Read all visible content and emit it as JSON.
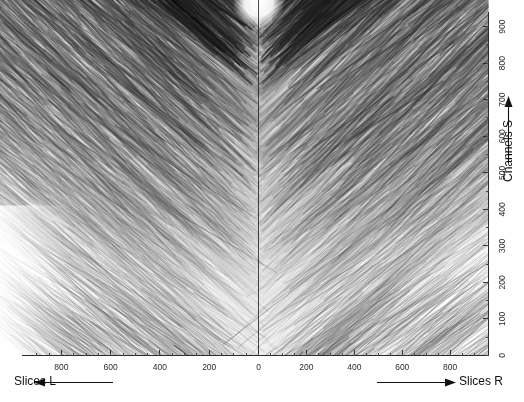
{
  "figure": {
    "width": 524,
    "height": 402,
    "background_color": "#ffffff",
    "ink_color": "#222222"
  },
  "chart_data": {
    "type": "heatmap",
    "title": "",
    "subtitle": "",
    "colormap": "greyscale",
    "grid": false,
    "legend": null,
    "xlabel": "Slices",
    "ylabel": "Channels S",
    "xaxis": {
      "name_left": "Slices L",
      "name_right": "Slices R",
      "arrow_left_direction": "left",
      "arrow_right_direction": "right",
      "mirrored_about_zero": true,
      "ticks_left": [
        800,
        600,
        400,
        200,
        0
      ],
      "ticks_right": [
        0,
        200,
        400,
        600,
        800
      ],
      "tick_step": 200,
      "minor_tick_step": 50,
      "range_left": [
        900,
        0
      ],
      "range_right": [
        0,
        900
      ]
    },
    "yaxis": {
      "name": "Channels S",
      "position": "right",
      "arrow_direction": "up",
      "ticks": [
        0,
        100,
        200,
        300,
        400,
        500,
        600,
        700,
        800,
        900
      ],
      "tick_step": 100,
      "minor_tick_step": 50,
      "ylim": [
        0,
        940
      ],
      "rotated_labels": true
    },
    "features": [
      {
        "name": "white-notch",
        "location": "top-centre",
        "description": "small bright white notch at the apex where the two streak fans meet"
      },
      {
        "name": "centre-line",
        "location": "x = 0",
        "description": "thin vertical line dividing left and right slice halves"
      },
      {
        "name": "left-fan",
        "description": "streaks rising toward the upper-left, densest near the centre"
      },
      {
        "name": "right-fan",
        "description": "streaks rising toward the upper-right, densest near the centre"
      },
      {
        "name": "sparse-corner-left",
        "location": "lower-left",
        "description": "faint, widely spaced streaks on white background"
      },
      {
        "name": "sparse-corner-right",
        "location": "lower-right",
        "description": "faint, widely spaced streaks on white background"
      }
    ]
  },
  "axes": {
    "x_tick_labels_left": [
      "800",
      "600",
      "400",
      "200",
      "0"
    ],
    "x_tick_labels_right": [
      "200",
      "400",
      "600",
      "800"
    ],
    "y_tick_labels": [
      "0",
      "100",
      "200",
      "300",
      "400",
      "500",
      "600",
      "700",
      "800",
      "900"
    ],
    "label_slices_left": "Slices L",
    "label_slices_right": "Slices R",
    "label_channels": "Channels S"
  }
}
